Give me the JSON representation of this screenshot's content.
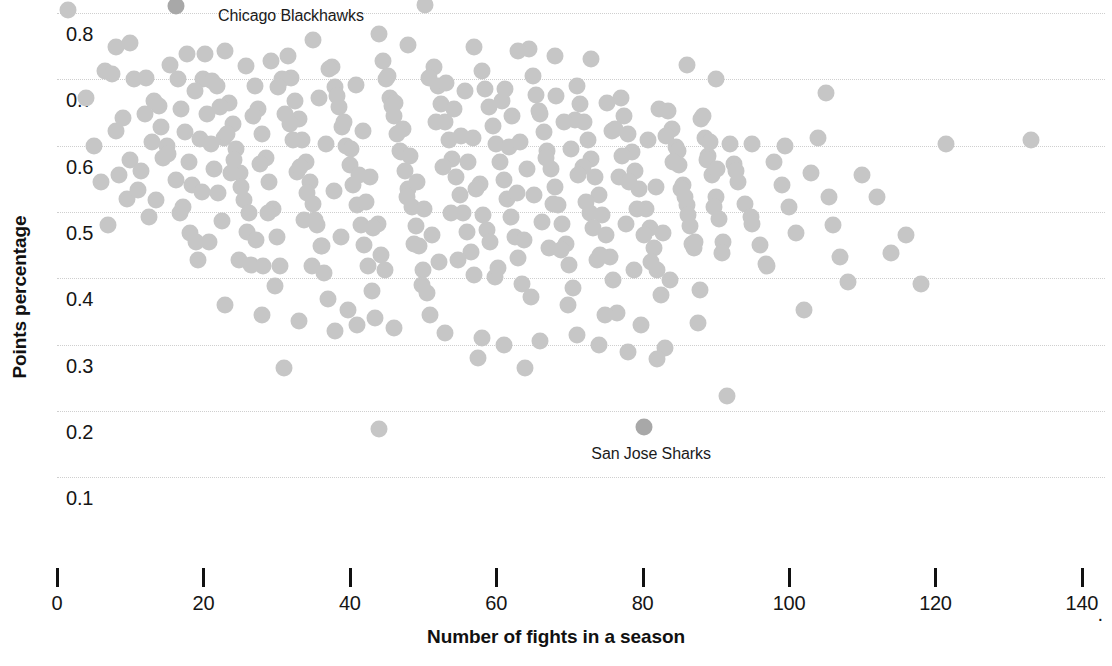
{
  "chart_data": {
    "type": "scatter",
    "title": "",
    "xlabel": "Number of fights in a season",
    "ylabel": "Points percentage",
    "xlim": [
      0,
      143
    ],
    "ylim": [
      0.075,
      0.835
    ],
    "grid": "horizontal dotted",
    "legend": "none",
    "x_ticks": [
      0,
      20,
      40,
      60,
      80,
      100,
      120,
      140
    ],
    "x_tick_labels": [
      "0",
      "20",
      "40",
      "60",
      "80",
      "100",
      "120",
      "140"
    ],
    "x_axis_truncated_marker": "·",
    "y_ticks": [
      0.1,
      0.2,
      0.3,
      0.4,
      0.5,
      0.6,
      0.7,
      0.8
    ],
    "y_tick_labels": [
      "0.1",
      "0.2",
      "0.3",
      "0.4",
      "0.5",
      "0.6",
      "0.7",
      "0.8"
    ],
    "marker": {
      "shape": "circle",
      "size_px": 17,
      "color": "#c6c6c6",
      "highlight_color": "#a8a8a8",
      "opacity": 1
    },
    "annotations": [
      {
        "label": "Chicago Blackhawks",
        "x": 16.2,
        "y": 0.81,
        "text_x": 22,
        "text_y": 0.795
      },
      {
        "label": "San Jose Sharks",
        "x": 80.2,
        "y": 0.175,
        "text_x": 73,
        "text_y": 0.135
      }
    ],
    "highlighted_points": [
      {
        "name": "Chicago Blackhawks",
        "x": 16.2,
        "y": 0.81
      },
      {
        "name": "San Jose Sharks",
        "x": 80.2,
        "y": 0.175
      }
    ],
    "points": [
      [
        1.5,
        0.805
      ],
      [
        4.0,
        0.672
      ],
      [
        6.5,
        0.712
      ],
      [
        7.5,
        0.708
      ],
      [
        8.0,
        0.622
      ],
      [
        8.5,
        0.555
      ],
      [
        9.5,
        0.52
      ],
      [
        10.0,
        0.578
      ],
      [
        6.0,
        0.545
      ],
      [
        11.0,
        0.533
      ],
      [
        12.5,
        0.492
      ],
      [
        13.0,
        0.605
      ],
      [
        14.0,
        0.66
      ],
      [
        15.0,
        0.6
      ],
      [
        16.2,
        0.81
      ],
      [
        16.5,
        0.7
      ],
      [
        17.0,
        0.655
      ],
      [
        17.5,
        0.62
      ],
      [
        18.0,
        0.575
      ],
      [
        18.5,
        0.54
      ],
      [
        19.0,
        0.455
      ],
      [
        19.5,
        0.61
      ],
      [
        20.0,
        0.7
      ],
      [
        20.5,
        0.648
      ],
      [
        21.0,
        0.602
      ],
      [
        21.5,
        0.565
      ],
      [
        22.0,
        0.528
      ],
      [
        22.5,
        0.487
      ],
      [
        23.0,
        0.742
      ],
      [
        23.5,
        0.665
      ],
      [
        24.0,
        0.632
      ],
      [
        24.5,
        0.595
      ],
      [
        25.0,
        0.558
      ],
      [
        25.5,
        0.518
      ],
      [
        26.0,
        0.47
      ],
      [
        26.5,
        0.42
      ],
      [
        27.0,
        0.69
      ],
      [
        27.5,
        0.655
      ],
      [
        28.0,
        0.618
      ],
      [
        28.5,
        0.582
      ],
      [
        29.0,
        0.545
      ],
      [
        29.5,
        0.505
      ],
      [
        30.0,
        0.462
      ],
      [
        30.5,
        0.418
      ],
      [
        31.0,
        0.265
      ],
      [
        31.5,
        0.735
      ],
      [
        32.0,
        0.702
      ],
      [
        32.5,
        0.668
      ],
      [
        33.0,
        0.64
      ],
      [
        33.5,
        0.608
      ],
      [
        34.0,
        0.575
      ],
      [
        34.5,
        0.545
      ],
      [
        35.0,
        0.512
      ],
      [
        35.5,
        0.48
      ],
      [
        36.0,
        0.448
      ],
      [
        36.5,
        0.408
      ],
      [
        37.0,
        0.368
      ],
      [
        37.5,
        0.718
      ],
      [
        38.0,
        0.688
      ],
      [
        38.5,
        0.658
      ],
      [
        39.0,
        0.628
      ],
      [
        39.5,
        0.6
      ],
      [
        40.0,
        0.57
      ],
      [
        40.5,
        0.54
      ],
      [
        41.0,
        0.51
      ],
      [
        41.5,
        0.48
      ],
      [
        42.0,
        0.45
      ],
      [
        42.5,
        0.418
      ],
      [
        43.0,
        0.38
      ],
      [
        43.5,
        0.34
      ],
      [
        44.0,
        0.172
      ],
      [
        44.5,
        0.728
      ],
      [
        45.0,
        0.7
      ],
      [
        45.5,
        0.672
      ],
      [
        46.0,
        0.645
      ],
      [
        46.5,
        0.618
      ],
      [
        47.0,
        0.59
      ],
      [
        47.5,
        0.562
      ],
      [
        48.0,
        0.535
      ],
      [
        48.5,
        0.508
      ],
      [
        49.0,
        0.478
      ],
      [
        49.5,
        0.448
      ],
      [
        50.0,
        0.412
      ],
      [
        50.3,
        0.812
      ],
      [
        50.5,
        0.378
      ],
      [
        51.0,
        0.345
      ],
      [
        51.5,
        0.718
      ],
      [
        52.0,
        0.69
      ],
      [
        52.5,
        0.662
      ],
      [
        53.0,
        0.635
      ],
      [
        53.5,
        0.608
      ],
      [
        54.0,
        0.58
      ],
      [
        54.5,
        0.552
      ],
      [
        55.0,
        0.525
      ],
      [
        55.5,
        0.498
      ],
      [
        56.0,
        0.47
      ],
      [
        56.5,
        0.44
      ],
      [
        57.0,
        0.405
      ],
      [
        57.5,
        0.28
      ],
      [
        58.0,
        0.712
      ],
      [
        58.5,
        0.685
      ],
      [
        59.0,
        0.658
      ],
      [
        59.5,
        0.63
      ],
      [
        60.0,
        0.602
      ],
      [
        60.5,
        0.575
      ],
      [
        61.0,
        0.548
      ],
      [
        61.5,
        0.52
      ],
      [
        62.0,
        0.492
      ],
      [
        62.5,
        0.462
      ],
      [
        63.0,
        0.43
      ],
      [
        63.5,
        0.392
      ],
      [
        64.0,
        0.265
      ],
      [
        64.5,
        0.745
      ],
      [
        65.0,
        0.705
      ],
      [
        65.5,
        0.676
      ],
      [
        66.0,
        0.648
      ],
      [
        66.5,
        0.62
      ],
      [
        67.0,
        0.592
      ],
      [
        67.5,
        0.565
      ],
      [
        68.0,
        0.538
      ],
      [
        68.5,
        0.51
      ],
      [
        69.0,
        0.482
      ],
      [
        69.5,
        0.452
      ],
      [
        70.0,
        0.42
      ],
      [
        70.5,
        0.385
      ],
      [
        71.0,
        0.69
      ],
      [
        71.5,
        0.662
      ],
      [
        72.0,
        0.635
      ],
      [
        72.5,
        0.608
      ],
      [
        73.0,
        0.58
      ],
      [
        73.5,
        0.552
      ],
      [
        74.0,
        0.525
      ],
      [
        74.5,
        0.495
      ],
      [
        75.0,
        0.465
      ],
      [
        75.5,
        0.432
      ],
      [
        76.0,
        0.398
      ],
      [
        76.5,
        0.348
      ],
      [
        77.0,
        0.672
      ],
      [
        77.5,
        0.645
      ],
      [
        78.0,
        0.618
      ],
      [
        78.5,
        0.59
      ],
      [
        79.0,
        0.562
      ],
      [
        79.5,
        0.535
      ],
      [
        80.2,
        0.175
      ],
      [
        80.5,
        0.505
      ],
      [
        81.0,
        0.475
      ],
      [
        81.5,
        0.445
      ],
      [
        82.0,
        0.412
      ],
      [
        82.5,
        0.375
      ],
      [
        83.0,
        0.295
      ],
      [
        83.5,
        0.652
      ],
      [
        84.0,
        0.625
      ],
      [
        84.5,
        0.598
      ],
      [
        85.0,
        0.57
      ],
      [
        85.5,
        0.54
      ],
      [
        86.0,
        0.51
      ],
      [
        86.5,
        0.478
      ],
      [
        87.0,
        0.445
      ],
      [
        87.5,
        0.332
      ],
      [
        88.0,
        0.64
      ],
      [
        88.5,
        0.612
      ],
      [
        89.0,
        0.585
      ],
      [
        89.5,
        0.555
      ],
      [
        90.0,
        0.522
      ],
      [
        90.5,
        0.49
      ],
      [
        91.0,
        0.455
      ],
      [
        91.5,
        0.222
      ],
      [
        92.0,
        0.602
      ],
      [
        92.5,
        0.572
      ],
      [
        93.0,
        0.545
      ],
      [
        94.0,
        0.512
      ],
      [
        95.0,
        0.482
      ],
      [
        96.0,
        0.45
      ],
      [
        97.0,
        0.418
      ],
      [
        98.0,
        0.575
      ],
      [
        99.0,
        0.54
      ],
      [
        100.0,
        0.508
      ],
      [
        101.0,
        0.468
      ],
      [
        102.0,
        0.352
      ],
      [
        103.0,
        0.558
      ],
      [
        104.0,
        0.612
      ],
      [
        105.0,
        0.68
      ],
      [
        105.5,
        0.522
      ],
      [
        106.0,
        0.48
      ],
      [
        107.0,
        0.432
      ],
      [
        108.0,
        0.395
      ],
      [
        110.0,
        0.555
      ],
      [
        112.0,
        0.522
      ],
      [
        114.0,
        0.438
      ],
      [
        116.0,
        0.465
      ],
      [
        118.0,
        0.392
      ],
      [
        121.5,
        0.602
      ],
      [
        133.0,
        0.608
      ],
      [
        5.0,
        0.6
      ],
      [
        7.0,
        0.48
      ],
      [
        9.0,
        0.642
      ],
      [
        10.5,
        0.7
      ],
      [
        11.5,
        0.562
      ],
      [
        12.0,
        0.648
      ],
      [
        13.5,
        0.518
      ],
      [
        14.5,
        0.582
      ],
      [
        15.5,
        0.722
      ],
      [
        16.8,
        0.498
      ],
      [
        17.8,
        0.738
      ],
      [
        18.8,
        0.682
      ],
      [
        19.8,
        0.53
      ],
      [
        20.8,
        0.455
      ],
      [
        21.8,
        0.69
      ],
      [
        22.8,
        0.612
      ],
      [
        23.8,
        0.558
      ],
      [
        24.8,
        0.428
      ],
      [
        25.8,
        0.72
      ],
      [
        26.8,
        0.645
      ],
      [
        27.8,
        0.572
      ],
      [
        28.8,
        0.498
      ],
      [
        29.8,
        0.388
      ],
      [
        30.8,
        0.7
      ],
      [
        31.8,
        0.632
      ],
      [
        32.8,
        0.56
      ],
      [
        33.8,
        0.488
      ],
      [
        34.8,
        0.418
      ],
      [
        35.8,
        0.672
      ],
      [
        36.8,
        0.602
      ],
      [
        37.8,
        0.532
      ],
      [
        38.8,
        0.462
      ],
      [
        39.8,
        0.352
      ],
      [
        40.8,
        0.692
      ],
      [
        41.8,
        0.622
      ],
      [
        42.8,
        0.552
      ],
      [
        43.8,
        0.482
      ],
      [
        44.8,
        0.412
      ],
      [
        45.8,
        0.66
      ],
      [
        46.8,
        0.592
      ],
      [
        47.8,
        0.522
      ],
      [
        48.8,
        0.452
      ],
      [
        49.8,
        0.39
      ],
      [
        50.8,
        0.702
      ],
      [
        51.8,
        0.635
      ],
      [
        52.8,
        0.568
      ],
      [
        53.8,
        0.498
      ],
      [
        54.8,
        0.428
      ],
      [
        55.8,
        0.682
      ],
      [
        56.8,
        0.612
      ],
      [
        57.8,
        0.542
      ],
      [
        58.8,
        0.472
      ],
      [
        59.8,
        0.402
      ],
      [
        60.8,
        0.668
      ],
      [
        61.8,
        0.598
      ],
      [
        62.8,
        0.528
      ],
      [
        63.8,
        0.458
      ],
      [
        64.8,
        0.372
      ],
      [
        65.8,
        0.652
      ],
      [
        66.8,
        0.582
      ],
      [
        67.8,
        0.512
      ],
      [
        68.8,
        0.442
      ],
      [
        69.8,
        0.36
      ],
      [
        70.8,
        0.638
      ],
      [
        71.8,
        0.568
      ],
      [
        72.8,
        0.498
      ],
      [
        73.8,
        0.428
      ],
      [
        74.8,
        0.345
      ],
      [
        75.8,
        0.622
      ],
      [
        76.8,
        0.552
      ],
      [
        77.8,
        0.482
      ],
      [
        78.8,
        0.412
      ],
      [
        79.8,
        0.33
      ],
      [
        80.8,
        0.608
      ],
      [
        81.8,
        0.538
      ],
      [
        82.8,
        0.468
      ],
      [
        83.8,
        0.398
      ],
      [
        84.8,
        0.592
      ],
      [
        85.8,
        0.522
      ],
      [
        86.8,
        0.452
      ],
      [
        87.8,
        0.382
      ],
      [
        88.8,
        0.578
      ],
      [
        89.8,
        0.508
      ],
      [
        90.8,
        0.438
      ],
      [
        92.8,
        0.562
      ],
      [
        94.8,
        0.492
      ],
      [
        96.8,
        0.422
      ],
      [
        12.2,
        0.702
      ],
      [
        13.2,
        0.668
      ],
      [
        14.2,
        0.628
      ],
      [
        15.2,
        0.588
      ],
      [
        16.2,
        0.548
      ],
      [
        17.2,
        0.508
      ],
      [
        18.2,
        0.468
      ],
      [
        19.2,
        0.428
      ],
      [
        20.2,
        0.738
      ],
      [
        21.2,
        0.698
      ],
      [
        22.2,
        0.658
      ],
      [
        23.2,
        0.618
      ],
      [
        24.2,
        0.578
      ],
      [
        25.2,
        0.538
      ],
      [
        26.2,
        0.498
      ],
      [
        27.2,
        0.458
      ],
      [
        28.2,
        0.418
      ],
      [
        29.2,
        0.728
      ],
      [
        30.2,
        0.688
      ],
      [
        31.2,
        0.648
      ],
      [
        32.2,
        0.608
      ],
      [
        33.2,
        0.568
      ],
      [
        34.2,
        0.528
      ],
      [
        35.2,
        0.488
      ],
      [
        36.2,
        0.448
      ],
      [
        37.2,
        0.715
      ],
      [
        38.2,
        0.675
      ],
      [
        39.2,
        0.635
      ],
      [
        40.2,
        0.595
      ],
      [
        41.2,
        0.555
      ],
      [
        42.2,
        0.515
      ],
      [
        43.2,
        0.475
      ],
      [
        44.2,
        0.435
      ],
      [
        45.2,
        0.705
      ],
      [
        46.2,
        0.665
      ],
      [
        47.2,
        0.625
      ],
      [
        48.2,
        0.585
      ],
      [
        49.2,
        0.545
      ],
      [
        50.2,
        0.505
      ],
      [
        51.2,
        0.465
      ],
      [
        52.2,
        0.425
      ],
      [
        53.2,
        0.695
      ],
      [
        54.2,
        0.655
      ],
      [
        55.2,
        0.615
      ],
      [
        56.2,
        0.575
      ],
      [
        57.2,
        0.535
      ],
      [
        58.2,
        0.495
      ],
      [
        59.2,
        0.455
      ],
      [
        60.2,
        0.415
      ],
      [
        61.2,
        0.685
      ],
      [
        62.2,
        0.645
      ],
      [
        63.2,
        0.605
      ],
      [
        64.2,
        0.565
      ],
      [
        65.2,
        0.525
      ],
      [
        66.2,
        0.485
      ],
      [
        67.2,
        0.445
      ],
      [
        68.2,
        0.675
      ],
      [
        69.2,
        0.635
      ],
      [
        70.2,
        0.595
      ],
      [
        71.2,
        0.555
      ],
      [
        72.2,
        0.515
      ],
      [
        73.2,
        0.475
      ],
      [
        74.2,
        0.435
      ],
      [
        75.2,
        0.665
      ],
      [
        76.2,
        0.625
      ],
      [
        77.2,
        0.585
      ],
      [
        78.2,
        0.545
      ],
      [
        79.2,
        0.505
      ],
      [
        80.2,
        0.465
      ],
      [
        81.2,
        0.425
      ],
      [
        82.2,
        0.655
      ],
      [
        83.2,
        0.615
      ],
      [
        84.2,
        0.575
      ],
      [
        85.2,
        0.535
      ],
      [
        86.2,
        0.495
      ],
      [
        87.2,
        0.455
      ],
      [
        88.2,
        0.645
      ],
      [
        89.2,
        0.605
      ],
      [
        90.2,
        0.565
      ],
      [
        23.0,
        0.36
      ],
      [
        28.0,
        0.345
      ],
      [
        33.0,
        0.335
      ],
      [
        38.0,
        0.32
      ],
      [
        41.0,
        0.33
      ],
      [
        46.0,
        0.325
      ],
      [
        53.0,
        0.318
      ],
      [
        58.0,
        0.31
      ],
      [
        61.0,
        0.3
      ],
      [
        66.0,
        0.305
      ],
      [
        71.0,
        0.315
      ],
      [
        74.0,
        0.3
      ],
      [
        78.0,
        0.288
      ],
      [
        82.0,
        0.278
      ],
      [
        8.0,
        0.748
      ],
      [
        10.0,
        0.755
      ],
      [
        35.0,
        0.76
      ],
      [
        44.0,
        0.768
      ],
      [
        48.0,
        0.752
      ],
      [
        57.0,
        0.748
      ],
      [
        63.0,
        0.742
      ],
      [
        68.0,
        0.735
      ],
      [
        73.0,
        0.73
      ],
      [
        86.0,
        0.722
      ],
      [
        90.0,
        0.7
      ],
      [
        95.0,
        0.602
      ],
      [
        99.5,
        0.6
      ]
    ]
  }
}
